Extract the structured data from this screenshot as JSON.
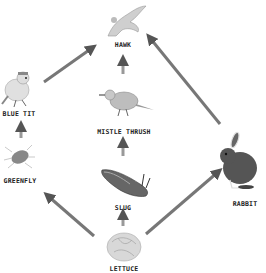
{
  "diagram": {
    "type": "food-web",
    "nodes": [
      {
        "id": "hawk",
        "label": "HAWK",
        "icon": "hawk-icon"
      },
      {
        "id": "blue_tit",
        "label": "BLUE TIT",
        "icon": "blue-tit-icon"
      },
      {
        "id": "mistle_thrush",
        "label": "MISTLE THRUSH",
        "icon": "mistle-thrush-icon"
      },
      {
        "id": "greenfly",
        "label": "GREENFLY",
        "icon": "greenfly-icon"
      },
      {
        "id": "slug",
        "label": "SLUG",
        "icon": "slug-icon"
      },
      {
        "id": "rabbit",
        "label": "RABBIT",
        "icon": "rabbit-icon"
      },
      {
        "id": "lettuce",
        "label": "LETTUCE",
        "icon": "lettuce-icon"
      }
    ],
    "edges": [
      {
        "from": "blue_tit",
        "to": "hawk"
      },
      {
        "from": "mistle_thrush",
        "to": "hawk"
      },
      {
        "from": "rabbit",
        "to": "hawk"
      },
      {
        "from": "greenfly",
        "to": "blue_tit"
      },
      {
        "from": "slug",
        "to": "mistle_thrush"
      },
      {
        "from": "lettuce",
        "to": "greenfly"
      },
      {
        "from": "lettuce",
        "to": "slug"
      },
      {
        "from": "lettuce",
        "to": "rabbit"
      }
    ],
    "colors": {
      "arrow": "#7a7a7a",
      "label": "#222222",
      "background": "#ffffff"
    }
  }
}
